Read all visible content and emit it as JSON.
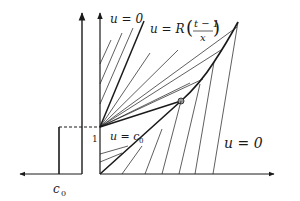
{
  "figure": {
    "labels": {
      "top_left_region": "u = 0",
      "fan_region_u": "u = R",
      "fan_frac_num": "t − 1",
      "fan_frac_den": "x",
      "constant_region": "u = c",
      "constant_region_sub": "0",
      "right_region": "u = 0",
      "tick_one": "1",
      "c0_label": "c",
      "c0_sub": "0"
    },
    "colors": {
      "line": "#1a1a1a",
      "marker_fill": "#9a9a9a",
      "background": "#ffffff"
    }
  }
}
